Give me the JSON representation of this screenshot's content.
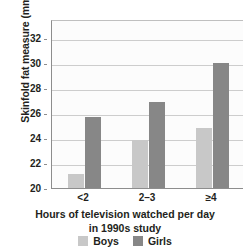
{
  "chart_data": {
    "type": "bar",
    "title": "",
    "xlabel": "Hours of television watched per day in 1990s study",
    "xlabel_line1": "Hours of television watched per day",
    "xlabel_line2": "in 1990s study",
    "ylabel": "Skinfold fat measure (mm)",
    "categories": [
      "<2",
      "2–3",
      "≥4"
    ],
    "series": [
      {
        "name": "Boys",
        "color": "#c8c8c8",
        "values": [
          21.1,
          23.8,
          24.8
        ]
      },
      {
        "name": "Girls",
        "color": "#878787",
        "values": [
          25.7,
          26.9,
          30.0
        ]
      }
    ],
    "ylim": [
      20,
      33.5
    ],
    "yticks": [
      20,
      22,
      24,
      26,
      28,
      30,
      32
    ],
    "ytick_labels": [
      "20",
      "22",
      "24",
      "26",
      "28",
      "30",
      "32"
    ],
    "grid": true,
    "grid_axis": "y",
    "legend_position": "bottom"
  },
  "legend": {
    "items": [
      {
        "label": "Boys",
        "swatch": "boys"
      },
      {
        "label": "Girls",
        "swatch": "girls"
      }
    ]
  }
}
